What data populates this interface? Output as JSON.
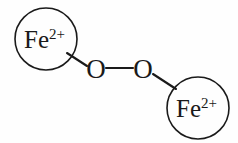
{
  "figure": {
    "name": "iron-peroxide-bridge-structure",
    "background_color": "#fefefe",
    "stroke_color": "#1a1a1a",
    "width": 238,
    "height": 143
  },
  "nodes": {
    "iron_left": {
      "element": "Fe",
      "charge": "2+",
      "full_label": "Fe2+",
      "cx": 46,
      "cy": 39,
      "r": 31
    },
    "oxygen_left": {
      "element": "O",
      "label": "O",
      "cx": 96,
      "cy": 68
    },
    "oxygen_right": {
      "element": "O",
      "label": "O",
      "cx": 143,
      "cy": 68
    },
    "iron_right": {
      "element": "Fe",
      "charge": "2+",
      "full_label": "Fe2+",
      "cx": 198,
      "cy": 108,
      "r": 31
    }
  },
  "bonds": [
    {
      "name": "bond-iron-left-oxygen-left",
      "from": "iron_left",
      "to": "oxygen_left",
      "x1": 67,
      "y1": 53,
      "x2": 87,
      "y2": 66,
      "order": 1
    },
    {
      "name": "bond-oxygen-oxygen",
      "from": "oxygen_left",
      "to": "oxygen_right",
      "x1": 106,
      "y1": 68,
      "x2": 133,
      "y2": 68,
      "order": 1
    },
    {
      "name": "bond-oxygen-right-iron-right",
      "from": "oxygen_right",
      "to": "iron_right",
      "x1": 153,
      "y1": 74,
      "x2": 176,
      "y2": 89,
      "order": 1
    }
  ]
}
